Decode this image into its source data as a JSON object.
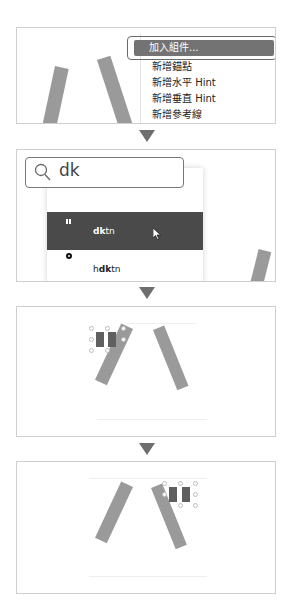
{
  "steps": [
    {
      "id": "context-menu",
      "menu": {
        "items": [
          {
            "label": "加入組件...",
            "active": true
          },
          {
            "label": "新增錨點",
            "active": false
          },
          {
            "label": "新增水平 Hint",
            "active": false
          },
          {
            "label": "新增垂直 Hint",
            "active": false
          },
          {
            "label": "新增參考線",
            "active": false
          }
        ]
      }
    },
    {
      "id": "component-search",
      "search": {
        "value": "dk",
        "icon": "search-icon"
      },
      "results": [
        {
          "prefix": "",
          "match": "dk",
          "suffix": "tn",
          "icon": "dakuten-icon",
          "selected": true
        },
        {
          "prefix": "h",
          "match": "dk",
          "suffix": "tn",
          "icon": "handakuten-icon",
          "selected": false
        }
      ]
    },
    {
      "id": "component-added",
      "glyph": "ハ",
      "component": "dakuten",
      "position": "top-left"
    },
    {
      "id": "component-moved",
      "glyph": "バ",
      "component": "dakuten",
      "position": "top-right"
    }
  ],
  "colors": {
    "glyph_stroke": "#9a9a9a",
    "component_mark": "#5f5f5f",
    "menu_highlight": "#737373",
    "result_selected": "#4a4a4a",
    "arrow": "#6e6e6e",
    "panel_border": "#cfcfcf"
  },
  "arrow_icon": "down-triangle-icon"
}
